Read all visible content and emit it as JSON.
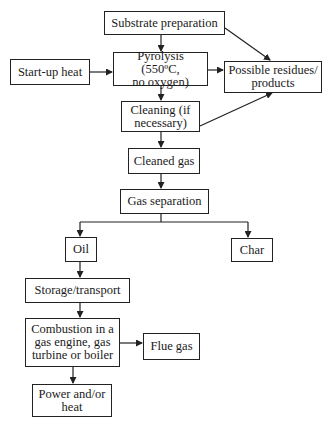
{
  "diagram": {
    "type": "flowchart",
    "nodes": {
      "substrate": {
        "label": "Substrate preparation"
      },
      "startup": {
        "label": "Start-up heat"
      },
      "pyrolysis": {
        "label": "Pyrolysis (550ºC,\nno oxygen)"
      },
      "residues": {
        "label": "Possible residues/\nproducts"
      },
      "cleaning": {
        "label": "Cleaning (if\nnecessary)"
      },
      "cleaned_gas": {
        "label": "Cleaned gas"
      },
      "gas_separation": {
        "label": "Gas separation"
      },
      "oil": {
        "label": "Oil"
      },
      "char": {
        "label": "Char"
      },
      "storage": {
        "label": "Storage/transport"
      },
      "combustion": {
        "label": "Combustion in a\ngas engine, gas\nturbine or boiler"
      },
      "flue_gas": {
        "label": "Flue gas"
      },
      "power": {
        "label": "Power and/or\nheat"
      }
    },
    "edges": [
      {
        "from": "substrate",
        "to": "pyrolysis"
      },
      {
        "from": "substrate",
        "to": "residues"
      },
      {
        "from": "startup",
        "to": "pyrolysis"
      },
      {
        "from": "pyrolysis",
        "to": "residues"
      },
      {
        "from": "pyrolysis",
        "to": "cleaning"
      },
      {
        "from": "cleaning",
        "to": "residues"
      },
      {
        "from": "cleaning",
        "to": "cleaned_gas"
      },
      {
        "from": "cleaned_gas",
        "to": "gas_separation"
      },
      {
        "from": "gas_separation",
        "to": "oil"
      },
      {
        "from": "gas_separation",
        "to": "char"
      },
      {
        "from": "oil",
        "to": "storage"
      },
      {
        "from": "storage",
        "to": "combustion"
      },
      {
        "from": "combustion",
        "to": "flue_gas"
      },
      {
        "from": "combustion",
        "to": "power"
      }
    ],
    "colors": {
      "line": "#222222",
      "box_border": "#222222",
      "background": "#ffffff",
      "text": "#1a1a1a"
    }
  }
}
